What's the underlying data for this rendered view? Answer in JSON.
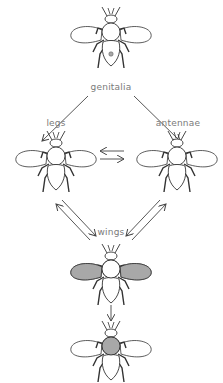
{
  "diagram": {
    "nodes": [
      {
        "id": "genitalia",
        "label": "genitalia",
        "highlight": "genitalia"
      },
      {
        "id": "legs",
        "label": "legs",
        "highlight": "none"
      },
      {
        "id": "antennae",
        "label": "antennae",
        "highlight": "none"
      },
      {
        "id": "wings",
        "label": "wings",
        "highlight": "wings"
      },
      {
        "id": "thorax",
        "label": "",
        "highlight": "thorax"
      }
    ],
    "edges": [
      {
        "from": "genitalia",
        "to": "legs"
      },
      {
        "from": "genitalia",
        "to": "antennae"
      },
      {
        "from": "legs",
        "to": "antennae",
        "bidirectional": true
      },
      {
        "from": "legs",
        "to": "wings",
        "bidirectional": true
      },
      {
        "from": "antennae",
        "to": "wings",
        "bidirectional": true
      },
      {
        "from": "wings",
        "to": "thorax"
      }
    ],
    "colors": {
      "line": "#444444",
      "highlight_fill": "#a8a8a8",
      "label": "#7a7a7a"
    }
  }
}
